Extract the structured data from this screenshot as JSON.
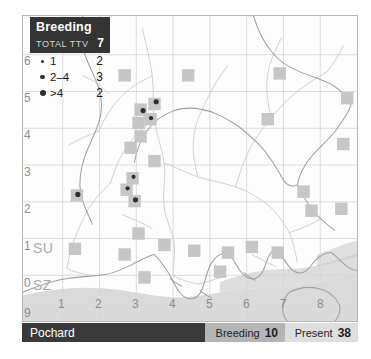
{
  "species": {
    "name": "Pochard"
  },
  "legend": {
    "title": "Breeding",
    "total_label": "TOTAL TTV",
    "total_value": "7",
    "rows": [
      {
        "label": "1",
        "count": "2",
        "dot_px": 3
      },
      {
        "label": "2–4",
        "count": "3",
        "dot_px": 4
      },
      {
        "label": ">4",
        "count": "2",
        "dot_px": 5
      }
    ]
  },
  "status_bar": {
    "species_label": "Pochard",
    "breeding_label": "Breeding",
    "breeding_value": "10",
    "present_label": "Present",
    "present_value": "38"
  },
  "axes": {
    "left_ticks": [
      "6",
      "5",
      "4",
      "3",
      "2",
      "1",
      "0",
      "9"
    ],
    "bottom_ticks": [
      "1",
      "2",
      "3",
      "4",
      "5",
      "6",
      "7",
      "8"
    ],
    "grid_square_labels": [
      "SU",
      "SZ"
    ]
  },
  "colors": {
    "legend_box": "#343434",
    "status_species": "#3a3a3a",
    "status_breeding": "#b5b5b5",
    "status_present": "#dedede",
    "map_background": "#fdfdfd",
    "map_border": "#b9b9b9",
    "grid_line": "#cfcfcf",
    "coastline": "#9a9a9a",
    "sea": "#d3d3d3",
    "river": "#c9c9c9",
    "present_square": "#c6c6c6",
    "breeding_dot": "#2f2f2f",
    "axis_text": "#8e8e8e"
  },
  "chart_data": {
    "type": "map",
    "title": "Pochard",
    "subtitle": "Breeding",
    "xlabel": "",
    "ylabel": "",
    "xlim": [
      0,
      8.4
    ],
    "ylim": [
      -1.6,
      6.4
    ],
    "grid": true,
    "legend_position": "top-left",
    "legend_entries": [
      {
        "label": "1",
        "count": 2
      },
      {
        "label": "2-4",
        "count": 3
      },
      {
        "label": ">4",
        "count": 2
      }
    ],
    "totals": {
      "total_ttv": 7,
      "breeding": 10,
      "present": 38
    },
    "present_squares": [
      {
        "x": 2.55,
        "y": 4.85
      },
      {
        "x": 4.15,
        "y": 4.85
      },
      {
        "x": 6.45,
        "y": 4.9
      },
      {
        "x": 3.3,
        "y": 4.1
      },
      {
        "x": 2.95,
        "y": 3.95
      },
      {
        "x": 3.2,
        "y": 3.7
      },
      {
        "x": 2.9,
        "y": 3.6
      },
      {
        "x": 2.95,
        "y": 3.25
      },
      {
        "x": 2.7,
        "y": 2.95
      },
      {
        "x": 6.15,
        "y": 3.7
      },
      {
        "x": 8.05,
        "y": 3.05
      },
      {
        "x": 2.75,
        "y": 2.15
      },
      {
        "x": 2.6,
        "y": 1.85
      },
      {
        "x": 2.8,
        "y": 1.55
      },
      {
        "x": 1.35,
        "y": 1.7
      },
      {
        "x": 7.05,
        "y": 1.8
      },
      {
        "x": 7.25,
        "y": 1.3
      },
      {
        "x": 8.0,
        "y": 1.35
      },
      {
        "x": 3.55,
        "y": 0.4
      },
      {
        "x": 1.3,
        "y": 0.3
      },
      {
        "x": 2.55,
        "y": 0.15
      },
      {
        "x": 4.3,
        "y": 0.25
      },
      {
        "x": 5.15,
        "y": 0.2
      },
      {
        "x": 5.75,
        "y": 0.35
      },
      {
        "x": 6.4,
        "y": 0.2
      },
      {
        "x": 3.05,
        "y": -0.45
      },
      {
        "x": 4.95,
        "y": -0.3
      },
      {
        "x": 2.9,
        "y": 0.7
      },
      {
        "x": 3.3,
        "y": 2.6
      },
      {
        "x": 8.15,
        "y": 4.25
      }
    ],
    "breeding_points": [
      {
        "x": 3.35,
        "y": 4.15,
        "size": 5
      },
      {
        "x": 3.02,
        "y": 3.92,
        "size": 5
      },
      {
        "x": 3.22,
        "y": 3.72,
        "size": 4
      },
      {
        "x": 2.78,
        "y": 2.18,
        "size": 4
      },
      {
        "x": 2.63,
        "y": 1.88,
        "size": 4
      },
      {
        "x": 2.83,
        "y": 1.58,
        "size": 5
      },
      {
        "x": 1.38,
        "y": 1.72,
        "size": 5
      }
    ]
  }
}
